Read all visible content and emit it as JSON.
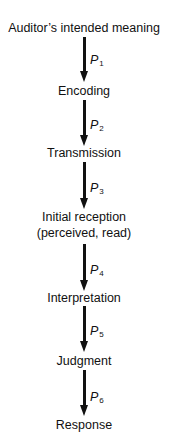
{
  "diagram": {
    "type": "vertical-flow",
    "nodes": [
      {
        "label": "Auditor’s intended meaning"
      },
      {
        "label": "Encoding"
      },
      {
        "label": "Transmission"
      },
      {
        "label": "Initial reception",
        "sublabel": "(perceived, read)"
      },
      {
        "label": "Interpretation"
      },
      {
        "label": "Judgment"
      },
      {
        "label": "Response"
      }
    ],
    "edges": [
      {
        "from": 0,
        "to": 1,
        "label": "P",
        "subscript": "1"
      },
      {
        "from": 1,
        "to": 2,
        "label": "P",
        "subscript": "2"
      },
      {
        "from": 2,
        "to": 3,
        "label": "P",
        "subscript": "3"
      },
      {
        "from": 3,
        "to": 4,
        "label": "P",
        "subscript": "4"
      },
      {
        "from": 4,
        "to": 5,
        "label": "P",
        "subscript": "5"
      },
      {
        "from": 5,
        "to": 6,
        "label": "P",
        "subscript": "6"
      }
    ],
    "colors": {
      "ink": "#111111",
      "background": "#ffffff"
    }
  }
}
